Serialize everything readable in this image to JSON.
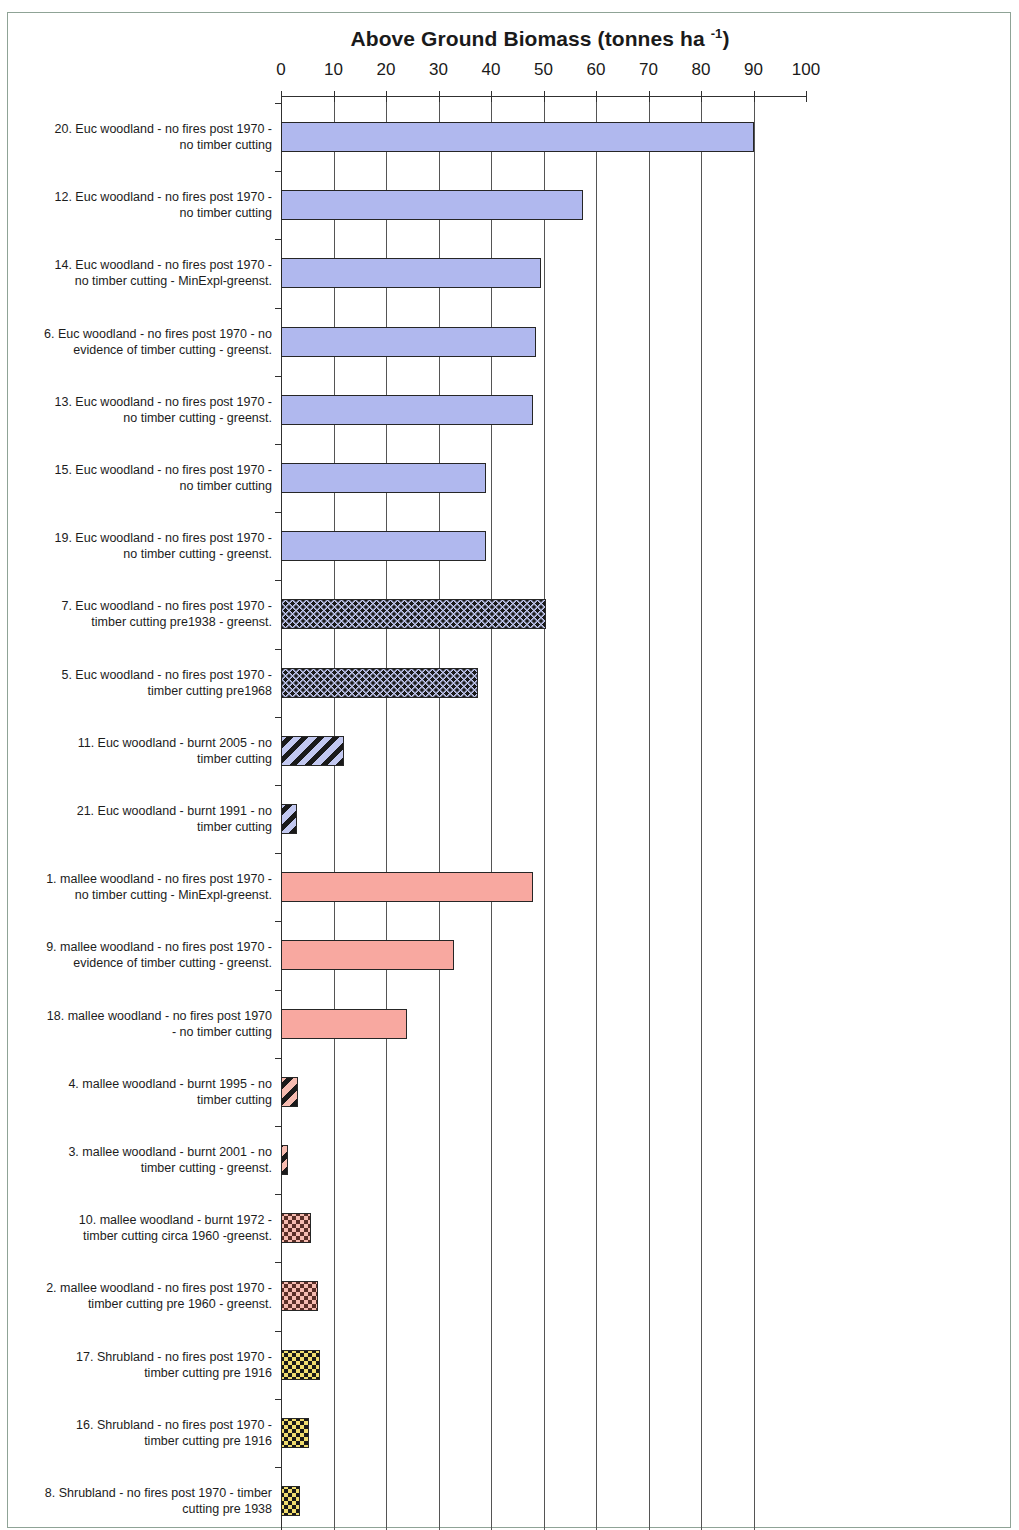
{
  "chart_data": {
    "type": "bar",
    "orientation": "horizontal",
    "title": "Above Ground Biomass (tonnes ha -1)",
    "title_main": "Above Ground Biomass (tonnes ha ",
    "title_superscript": "-1",
    "title_close": ")",
    "xlabel": "",
    "ylabel": "",
    "xlim": [
      0,
      100
    ],
    "xticks": [
      0,
      10,
      20,
      30,
      40,
      50,
      60,
      70,
      80,
      90,
      100
    ],
    "xtick_labels": [
      "0",
      "10",
      "20",
      "30",
      "40",
      "50",
      "60",
      "70",
      "80",
      "90",
      "100"
    ],
    "grid": "vertical",
    "legend": "none",
    "categories": [
      "20. Euc woodland - no fires post 1970 - no timber cutting",
      "12. Euc woodland - no fires post 1970 - no timber cutting",
      "14. Euc woodland - no fires post 1970 - no timber cutting - MinExpl-greenst.",
      "6. Euc woodland - no fires post 1970 - no evidence of timber cutting - greenst.",
      "13. Euc woodland - no fires post 1970 - no timber cutting - greenst.",
      "15. Euc woodland - no fires post 1970 - no timber cutting",
      "19. Euc woodland - no fires post 1970 - no timber cutting - greenst.",
      "7. Euc woodland - no fires post 1970 - timber cutting pre1938 - greenst.",
      "5. Euc woodland - no fires post 1970 - timber cutting pre1968",
      "11. Euc woodland - burnt 2005 - no timber cutting",
      "21. Euc woodland - burnt 1991 - no timber cutting",
      "1. mallee woodland - no fires post 1970 - no timber cutting - MinExpl-greenst.",
      "9. mallee woodland - no fires post 1970 - evidence of timber cutting - greenst.",
      "18. mallee woodland - no fires post 1970 - no timber cutting",
      "4. mallee woodland - burnt 1995 - no timber cutting",
      "3. mallee woodland - burnt 2001 - no timber cutting - greenst.",
      "10. mallee woodland - burnt 1972 - timber cutting circa 1960 -greenst.",
      "2. mallee woodland - no fires post 1970 - timber cutting pre 1960 - greenst.",
      "17. Shrubland - no fires post 1970 - timber cutting pre 1916",
      "16. Shrubland - no fires post 1970 - timber cutting pre 1916",
      "8. Shrubland - no fires post 1970 - timber cutting pre 1938"
    ],
    "values": [
      90.0,
      57.5,
      49.5,
      48.5,
      48.0,
      39.0,
      39.0,
      50.5,
      37.5,
      12.0,
      3.0,
      48.0,
      33.0,
      24.0,
      3.2,
      1.3,
      5.8,
      7.0,
      7.5,
      5.4,
      3.6
    ],
    "fills": [
      "solid-blue",
      "solid-blue",
      "solid-blue",
      "solid-blue",
      "solid-blue",
      "solid-blue",
      "solid-blue",
      "dotted-blue",
      "dotted-blue",
      "striped-blue",
      "striped-blue",
      "solid-pink",
      "solid-pink",
      "solid-pink",
      "striped-pink",
      "striped-pink",
      "dotted-pink",
      "dotted-pink",
      "dotted-yellow",
      "dotted-yellow",
      "dotted-yellow"
    ],
    "colors": {
      "euc_solid": "#b0b8ee",
      "euc_pattern_base": "#c2c8f0",
      "mallee_solid": "#f8a8a0",
      "mallee_pattern_base": "#f6bbb0",
      "shrubland": "#f0dc6e",
      "pattern_dark": "#1a1a1a",
      "mallee_dot": "#5b2f28",
      "outline": "#262626",
      "axis": "#303030",
      "gridline": "#555555",
      "page_border": "#8fa396"
    }
  }
}
